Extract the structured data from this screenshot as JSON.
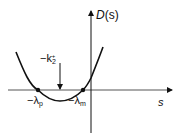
{
  "diagram": {
    "type": "function-plot-sketch",
    "axes": {
      "y_label_fn": "D",
      "y_label_arg": "(s)",
      "x_label": "s"
    },
    "curve": {
      "shape": "upward parabola",
      "roots": [
        "-λp",
        "-λm"
      ],
      "minimum_marker": "-k2+"
    },
    "labels": {
      "root_left": {
        "prefix": "−λ",
        "sub": "p"
      },
      "root_right": {
        "prefix": "−λ",
        "sub": "m"
      },
      "arrow": {
        "prefix": "−k",
        "sub": "2",
        "sup": "+"
      }
    },
    "colors": {
      "ink": "#111111",
      "background": "#ffffff"
    }
  }
}
